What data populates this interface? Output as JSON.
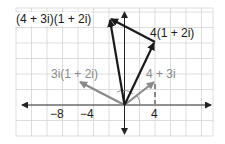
{
  "diagram": {
    "type": "complex-plane-vector-diagram",
    "colors": {
      "grid": "#d4d4d4",
      "axis": "#222222",
      "dark_vector": "#1a1a1a",
      "gray_vector": "#8a8a8a",
      "gray_label": "#8a8a8a"
    },
    "labels": {
      "product": "(4 + 3i)(1 + 2i)",
      "scaled": "4(1 + 2i)",
      "rotated": "3i(1 + 2i)",
      "base": "4 + 3i"
    },
    "ticks": {
      "neg8": "−8",
      "neg4": "−4",
      "pos4": "4"
    },
    "points": {
      "base": [
        4,
        3
      ],
      "scaled": [
        4,
        8
      ],
      "rotated": [
        -6,
        3
      ],
      "product": [
        -2,
        11
      ]
    }
  }
}
